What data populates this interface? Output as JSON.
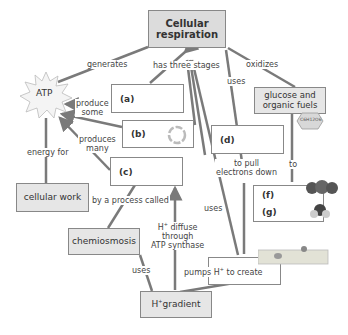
{
  "nodes": {
    "cellular_respiration": "Cellular respiration",
    "atp": "ATP",
    "cellular_work": "cellular work",
    "chemiosmosis": "chemiosmosis",
    "h_gradient_prefix": "H",
    "h_gradient_sup": "+",
    "h_gradient_suffix": "gradient",
    "glucose": "glucose and organic fuels",
    "glucose_formula": "C6H12O6"
  },
  "blanks": {
    "a": "(a)",
    "b": "(b)",
    "c": "(c)",
    "d": "(d)",
    "e": "(e)",
    "f": "(f)",
    "g": "(g)"
  },
  "links": {
    "generates": "generates",
    "has_three_stages": "has three stages",
    "oxidizes": "oxidizes",
    "uses_d": "uses",
    "produce_some_1": "produce",
    "produce_some_2": "some",
    "produces_many_1": "produces",
    "produces_many_2": "many",
    "energy_for": "energy for",
    "to_pull_1": "to pull",
    "to_pull_2": "electrons down",
    "to": "to",
    "by_process": "by a process called",
    "uses_e": "uses",
    "h_diffuse_1_pre": "H",
    "h_diffuse_1_post": " diffuse",
    "h_diffuse_2": "through",
    "h_diffuse_3": "ATP synthase",
    "uses_gradient": "uses",
    "pumps_pre": "pumps H",
    "pumps_post": " to create",
    "plus": "+"
  },
  "colors": {
    "node_fill": "#e6e6e6",
    "title_fill": "#dcdcdc",
    "line": "#7a7a7a",
    "border": "#888888"
  }
}
